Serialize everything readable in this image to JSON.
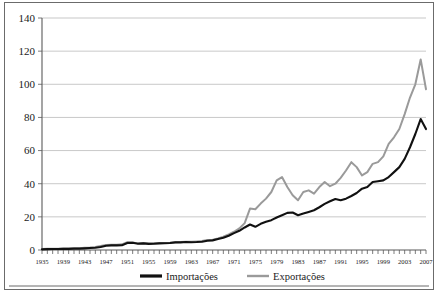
{
  "chart_data": {
    "type": "line",
    "title": "",
    "xlabel": "",
    "ylabel": "",
    "ylim": [
      0,
      140
    ],
    "ytick_step": 20,
    "yticks": [
      "0",
      "20",
      "40",
      "60",
      "80",
      "100",
      "120",
      "140"
    ],
    "xlim": [
      1935,
      2007
    ],
    "xtick_step": 1,
    "xlabel_step": 4,
    "xticklabels": [
      "1935",
      "1939",
      "1943",
      "1947",
      "1951",
      "1955",
      "1959",
      "1963",
      "1967",
      "1971",
      "1975",
      "1979",
      "1983",
      "1987",
      "1991",
      "1995",
      "1999",
      "2003",
      "2007"
    ],
    "grid": "horizontal",
    "legend_position": "bottom",
    "x": [
      1935,
      1936,
      1937,
      1938,
      1939,
      1940,
      1941,
      1942,
      1943,
      1944,
      1945,
      1946,
      1947,
      1948,
      1949,
      1950,
      1951,
      1952,
      1953,
      1954,
      1955,
      1956,
      1957,
      1958,
      1959,
      1960,
      1961,
      1962,
      1963,
      1964,
      1965,
      1966,
      1967,
      1968,
      1969,
      1970,
      1971,
      1972,
      1973,
      1974,
      1975,
      1976,
      1977,
      1978,
      1979,
      1980,
      1981,
      1982,
      1983,
      1984,
      1985,
      1986,
      1987,
      1988,
      1989,
      1990,
      1991,
      1992,
      1993,
      1994,
      1995,
      1996,
      1997,
      1998,
      1999,
      2000,
      2001,
      2002,
      2003,
      2004,
      2005,
      2006,
      2007
    ],
    "series": [
      {
        "name": "Importações",
        "color": "#111111",
        "width": 2.1,
        "values": [
          0.4,
          0.5,
          0.6,
          0.6,
          0.7,
          0.7,
          0.8,
          0.8,
          1.0,
          1.2,
          1.4,
          1.8,
          2.6,
          2.8,
          2.8,
          2.9,
          4.2,
          4.4,
          3.8,
          4.0,
          3.7,
          3.8,
          4.0,
          4.1,
          4.2,
          4.6,
          4.6,
          4.8,
          4.7,
          4.8,
          5.0,
          5.6,
          5.8,
          6.6,
          7.4,
          8.6,
          10.2,
          11.6,
          13.6,
          15.4,
          14.0,
          15.8,
          17.0,
          18.0,
          19.6,
          21.0,
          22.4,
          22.6,
          21.0,
          22.0,
          23.0,
          24.0,
          25.8,
          27.8,
          29.4,
          30.8,
          30.0,
          31.0,
          32.6,
          34.4,
          37.0,
          38.0,
          41.0,
          41.5,
          42.0,
          44.0,
          47.0,
          50.0,
          55.0,
          62.0,
          70.0,
          79.0,
          73.0
        ]
      },
      {
        "name": "Exportações",
        "color": "#9a9a9a",
        "width": 2.0,
        "values": [
          0.6,
          0.7,
          0.8,
          0.8,
          0.9,
          0.9,
          1.0,
          1.1,
          1.3,
          1.5,
          1.8,
          2.4,
          3.0,
          3.2,
          3.1,
          3.4,
          4.8,
          4.6,
          4.0,
          4.2,
          3.9,
          4.0,
          4.2,
          4.2,
          4.4,
          4.7,
          4.8,
          5.0,
          5.0,
          5.2,
          5.4,
          6.0,
          6.2,
          7.0,
          8.0,
          9.4,
          11.0,
          13.0,
          16.2,
          25.0,
          24.6,
          28.0,
          31.0,
          35.0,
          42.0,
          44.0,
          38.0,
          33.0,
          30.0,
          35.0,
          36.0,
          34.0,
          38.0,
          41.0,
          38.5,
          40.0,
          43.5,
          48.0,
          53.0,
          50.0,
          45.0,
          47.0,
          52.0,
          53.0,
          56.5,
          64.0,
          68.0,
          73.0,
          82.0,
          92.0,
          100.0,
          115.0,
          97.0
        ]
      }
    ],
    "legend": [
      {
        "label": "Importações",
        "color": "#111111",
        "width": 3.2
      },
      {
        "label": "Exportações",
        "color": "#9a9a9a",
        "width": 2.4
      }
    ]
  }
}
